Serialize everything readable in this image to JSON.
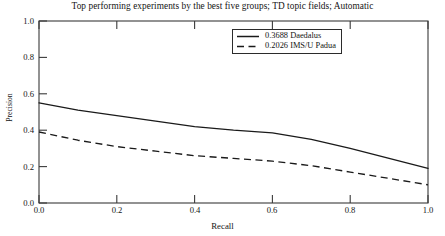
{
  "chart_data": {
    "type": "line",
    "title": "Top performing experiments by the best five groups; TD topic fields; Automatic",
    "xlabel": "Recall",
    "ylabel": "Precision",
    "xlim": [
      0.0,
      1.0
    ],
    "ylim": [
      0.0,
      1.0
    ],
    "grid": false,
    "legend_position": "upper-center",
    "xticks": [
      "0.0",
      "0.2",
      "0.4",
      "0.6",
      "0.8",
      "1.0"
    ],
    "xtick_values": [
      0.0,
      0.2,
      0.4,
      0.6,
      0.8,
      1.0
    ],
    "yticks": [
      "0.0",
      "0.2",
      "0.4",
      "0.6",
      "0.8",
      "1.0"
    ],
    "ytick_values": [
      0.0,
      0.2,
      0.4,
      0.6,
      0.8,
      1.0
    ],
    "x": [
      0.0,
      0.1,
      0.2,
      0.3,
      0.4,
      0.5,
      0.6,
      0.7,
      0.8,
      0.9,
      1.0
    ],
    "series": [
      {
        "name": "0.3688 Daedalus",
        "map_score": "0.3688",
        "group": "Daedalus",
        "style": "solid",
        "color": "#1a1a1a",
        "values": [
          0.55,
          0.51,
          0.48,
          0.45,
          0.42,
          0.4,
          0.385,
          0.35,
          0.3,
          0.245,
          0.19
        ]
      },
      {
        "name": "0.2026 IMS/U Padua",
        "map_score": "0.2026",
        "group": "IMS/U Padua",
        "style": "dashed",
        "color": "#1a1a1a",
        "values": [
          0.39,
          0.345,
          0.31,
          0.285,
          0.26,
          0.245,
          0.23,
          0.205,
          0.17,
          0.135,
          0.1
        ]
      }
    ]
  },
  "legend": {
    "entries": [
      {
        "label": "0.3688 Daedalus",
        "style": "solid"
      },
      {
        "label": "0.2026 IMS/U Padua",
        "style": "dashed"
      }
    ]
  }
}
